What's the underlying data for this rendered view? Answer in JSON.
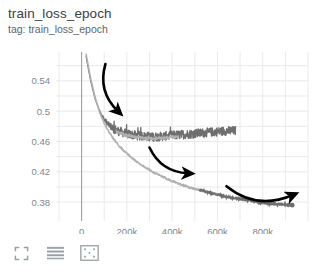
{
  "panel": {
    "title": "train_loss_epoch",
    "subtitle": "tag: train_loss_epoch"
  },
  "toolbar": {
    "items": [
      {
        "name": "fullscreen-icon",
        "label": "Toggle fullscreen"
      },
      {
        "name": "lines-icon",
        "label": "Toggle data table"
      },
      {
        "name": "fit-domain-icon",
        "label": "Fit domain to data"
      }
    ]
  },
  "colors": {
    "background": "#ffffff",
    "grid": "#e8eaed",
    "axis": "#9aa0a6",
    "tick_text": "#80868b",
    "title_text": "#3c4043",
    "subtitle_text": "#5f6368",
    "series_light": "#b0b0b0",
    "series_dark": "#6e6e6e",
    "annotation": "#000000"
  },
  "chart_data": {
    "type": "line",
    "title": "train_loss_epoch",
    "subtitle": "tag: train_loss_epoch",
    "xlabel": "",
    "ylabel": "",
    "xlim": [
      -60000,
      1000000
    ],
    "ylim": [
      0.363,
      0.578
    ],
    "grid": true,
    "legend": "none",
    "xticks": [
      0,
      200000,
      400000,
      600000,
      800000
    ],
    "xticklabels": [
      "0",
      "200k",
      "400k",
      "600k",
      "800k"
    ],
    "yticks": [
      0.54,
      0.5,
      0.46,
      0.42,
      0.38
    ],
    "yticklabels": [
      "0.54",
      "0.5",
      "0.46",
      "0.42",
      "0.38"
    ],
    "series": [
      {
        "name": "noisy-run",
        "color": "#6e6e6e",
        "noise_amplitude": 0.006,
        "x": [
          20000,
          40000,
          60000,
          80000,
          100000,
          120000,
          140000,
          160000,
          180000,
          200000,
          240000,
          280000,
          320000,
          360000,
          400000,
          440000,
          480000,
          520000,
          560000,
          600000,
          640000,
          680000
        ],
        "y": [
          0.572,
          0.54,
          0.516,
          0.5,
          0.489,
          0.482,
          0.477,
          0.474,
          0.472,
          0.47,
          0.468,
          0.467,
          0.466,
          0.467,
          0.468,
          0.469,
          0.47,
          0.471,
          0.472,
          0.473,
          0.474,
          0.474
        ]
      },
      {
        "name": "smooth-run",
        "color": "#b0b0b0",
        "noise_amplitude": 0.0012,
        "x": [
          20000,
          40000,
          60000,
          80000,
          100000,
          120000,
          140000,
          160000,
          200000,
          240000,
          280000,
          320000,
          360000,
          400000,
          440000,
          480000,
          520000,
          560000,
          600000,
          640000,
          680000,
          720000,
          760000,
          800000,
          840000,
          880000,
          930000
        ],
        "y": [
          0.575,
          0.543,
          0.518,
          0.498,
          0.484,
          0.473,
          0.464,
          0.456,
          0.444,
          0.434,
          0.426,
          0.419,
          0.413,
          0.408,
          0.403,
          0.399,
          0.396,
          0.393,
          0.39,
          0.387,
          0.385,
          0.383,
          0.381,
          0.379,
          0.378,
          0.377,
          0.376
        ]
      }
    ],
    "annotations": [
      {
        "name": "arrow-1",
        "type": "curved-arrow",
        "from": [
          105000,
          0.562
        ],
        "to": [
          160000,
          0.5
        ],
        "direction": "down-right"
      },
      {
        "name": "arrow-2",
        "type": "curved-arrow",
        "from": [
          300000,
          0.452
        ],
        "to": [
          470000,
          0.418
        ],
        "direction": "down-right"
      },
      {
        "name": "arrow-3",
        "type": "curved-arrow",
        "from": [
          640000,
          0.401
        ],
        "to": [
          930000,
          0.389
        ],
        "direction": "right"
      }
    ]
  }
}
